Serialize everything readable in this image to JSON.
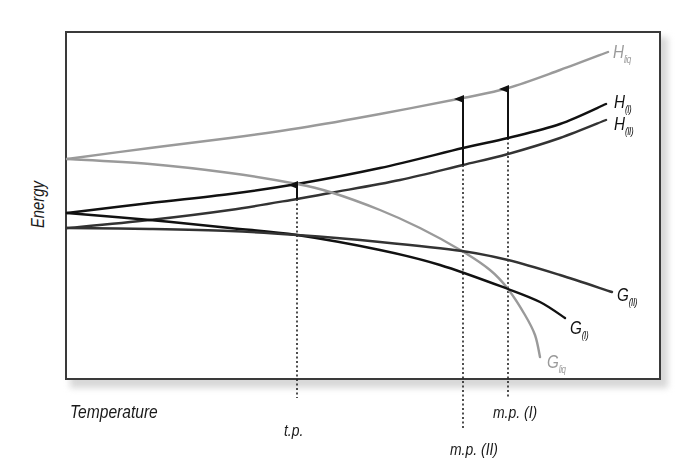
{
  "chart_data": {
    "type": "line",
    "title": "",
    "xlabel": "Temperature",
    "ylabel": "Energy",
    "grid": false,
    "legend": "inline labels at curve ends",
    "series": [
      {
        "name": "H_liq",
        "label_main": "H",
        "label_sub": "liq",
        "color": "#9a9a9a",
        "points": [
          [
            67,
            159
          ],
          [
            150,
            148
          ],
          [
            230,
            138
          ],
          [
            300,
            128
          ],
          [
            380,
            114
          ],
          [
            463,
            98
          ],
          [
            508,
            88
          ],
          [
            560,
            70
          ],
          [
            608,
            52
          ]
        ]
      },
      {
        "name": "H_(I)",
        "label_main": "H",
        "label_sub": "(I)",
        "color": "#111111",
        "points": [
          [
            67,
            213
          ],
          [
            150,
            203
          ],
          [
            230,
            194
          ],
          [
            297,
            184
          ],
          [
            380,
            168
          ],
          [
            463,
            148
          ],
          [
            508,
            138
          ],
          [
            560,
            124
          ],
          [
            606,
            104
          ]
        ]
      },
      {
        "name": "H_(II)",
        "label_main": "H",
        "label_sub": "(II)",
        "color": "#333333",
        "points": [
          [
            67,
            228
          ],
          [
            150,
            220
          ],
          [
            230,
            210
          ],
          [
            297,
            199
          ],
          [
            330,
            193
          ],
          [
            400,
            180
          ],
          [
            463,
            165
          ],
          [
            508,
            154
          ],
          [
            560,
            138
          ],
          [
            606,
            120
          ]
        ]
      },
      {
        "name": "G_liq",
        "label_main": "G",
        "label_sub": "liq",
        "color": "#9a9a9a",
        "points": [
          [
            67,
            159
          ],
          [
            150,
            164
          ],
          [
            230,
            173
          ],
          [
            297,
            184
          ],
          [
            330,
            192
          ],
          [
            380,
            210
          ],
          [
            420,
            228
          ],
          [
            462,
            251
          ],
          [
            490,
            270
          ],
          [
            508,
            289
          ],
          [
            525,
            315
          ],
          [
            535,
            335
          ],
          [
            540,
            357
          ]
        ]
      },
      {
        "name": "G_(I)",
        "label_main": "G",
        "label_sub": "(I)",
        "color": "#111111",
        "points": [
          [
            67,
            213
          ],
          [
            150,
            220
          ],
          [
            230,
            228
          ],
          [
            297,
            235
          ],
          [
            380,
            250
          ],
          [
            440,
            265
          ],
          [
            508,
            289
          ],
          [
            540,
            302
          ],
          [
            565,
            318
          ]
        ]
      },
      {
        "name": "G_(II)",
        "label_main": "G",
        "label_sub": "(II)",
        "color": "#333333",
        "points": [
          [
            67,
            228
          ],
          [
            150,
            229
          ],
          [
            230,
            231
          ],
          [
            297,
            235
          ],
          [
            380,
            242
          ],
          [
            462,
            251
          ],
          [
            508,
            260
          ],
          [
            560,
            275
          ],
          [
            612,
            292
          ]
        ]
      }
    ],
    "annotations": [
      {
        "label": "t.p.",
        "x": 297,
        "from_y": 199,
        "to_y": 184,
        "dotted_to": 398
      },
      {
        "label": "m.p. (II)",
        "x": 463,
        "from_y": 165,
        "to_y": 98,
        "dotted_to": 430
      },
      {
        "label": "m.p. (I)",
        "x": 508,
        "from_y": 138,
        "to_y": 88,
        "dotted_to": 398
      }
    ]
  },
  "axes": {
    "ylabel": "Energy",
    "xlabel": "Temperature"
  },
  "markers": {
    "tp": "t.p.",
    "mp2": "m.p. (II)",
    "mp1": "m.p. (I)"
  },
  "labels": {
    "H_liq": {
      "main": "H",
      "sub": "liq"
    },
    "H_I": {
      "main": "H",
      "sub": "(I)"
    },
    "H_II": {
      "main": "H",
      "sub": "(II)"
    },
    "G_liq": {
      "main": "G",
      "sub": "liq"
    },
    "G_I": {
      "main": "G",
      "sub": "(I)"
    },
    "G_II": {
      "main": "G",
      "sub": "(II)"
    }
  }
}
